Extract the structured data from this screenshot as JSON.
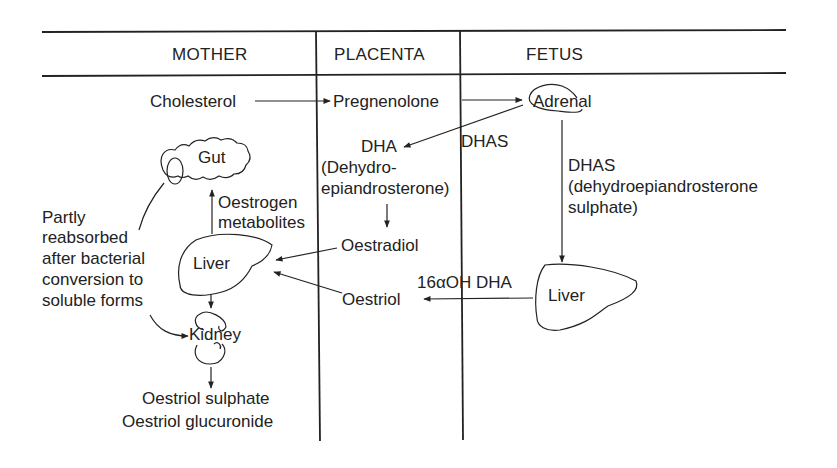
{
  "columns": {
    "mother": "MOTHER",
    "placenta": "PLACENTA",
    "fetus": "FETUS"
  },
  "nodes": {
    "cholesterol": "Cholesterol",
    "pregnenolone": "Pregnenolone",
    "adrenal": "Adrenal",
    "dha": "DHA",
    "dha_full_1": "(Dehydro-",
    "dha_full_2": "epiandrosterone)",
    "dhas_placenta": "DHAS",
    "dhas_fetus": "DHAS",
    "dhas_full_1": "(dehydroepiandrosterone",
    "dhas_full_2": "sulphate)",
    "gut": "Gut",
    "oestrogen_1": "Oestrogen",
    "oestrogen_2": "metabolites",
    "partly_1": "Partly",
    "partly_2": "reabsorbed",
    "partly_3": "after bacterial",
    "partly_4": "conversion to",
    "partly_5": "soluble forms",
    "liver_mother": "Liver",
    "oestradiol": "Oestradiol",
    "oestriol": "Oestriol",
    "hydroxy_dha": "16αOH DHA",
    "liver_fetus": "Liver",
    "kidney": "Kidney",
    "sulphate": "Oestriol sulphate",
    "glucuronide": "Oestriol glucuronide"
  },
  "colors": {
    "ink": "#222222",
    "background": "#ffffff"
  }
}
